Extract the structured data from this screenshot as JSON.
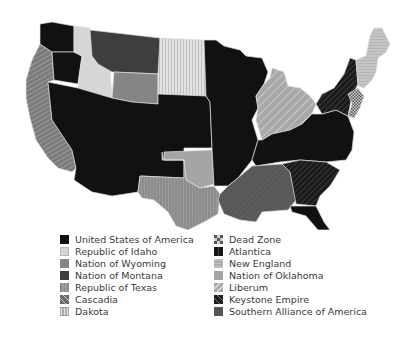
{
  "map": {
    "title": "Divided United States factions map",
    "colors": {
      "usa": "#111111",
      "idaho": "#d6d6d6",
      "wyoming": "#858585",
      "montana": "#3e3e3e",
      "texas": "#8a8a8a",
      "cascadia": "#7a7a7a",
      "dakota": "#d0d0d0",
      "deadzone": "#9a9a9a",
      "atlantica": "#141414",
      "newengland": "#b8b8b8",
      "oklahoma": "#a5a5a5",
      "liberum": "#b0b0b0",
      "keystone": "#1c1c1c",
      "southern": "#555555"
    }
  },
  "legend": {
    "left": [
      {
        "label": "United States of America",
        "key": "usa"
      },
      {
        "label": "Republic of Idaho",
        "key": "idaho"
      },
      {
        "label": "Nation of Wyoming",
        "key": "wyoming"
      },
      {
        "label": "Nation of Montana",
        "key": "montana"
      },
      {
        "label": "Republic of Texas",
        "key": "texas"
      },
      {
        "label": "Cascadia",
        "key": "cascadia"
      },
      {
        "label": "Dakota",
        "key": "dakota"
      }
    ],
    "right": [
      {
        "label": "Dead Zone",
        "key": "deadzone"
      },
      {
        "label": "Atlantica",
        "key": "atlantica"
      },
      {
        "label": "New England",
        "key": "newengland"
      },
      {
        "label": "Nation of Oklahoma",
        "key": "oklahoma"
      },
      {
        "label": "Liberum",
        "key": "liberum"
      },
      {
        "label": "Keystone Empire",
        "key": "keystone"
      },
      {
        "label": "Southern Alliance of America",
        "key": "southern"
      }
    ]
  }
}
